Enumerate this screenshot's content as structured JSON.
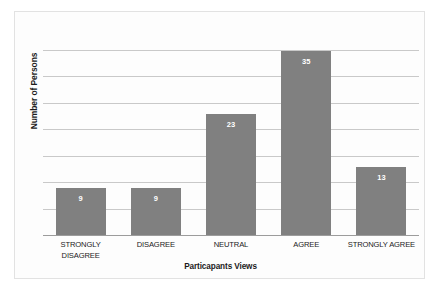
{
  "chart_data": {
    "type": "bar",
    "title": "",
    "xlabel": "Particapants Views",
    "ylabel": "Number of Persons",
    "categories": [
      "STRONGLY DISAGREE",
      "DISAGREE",
      "NEUTRAL",
      "AGREE",
      "STRONGLY AGREE"
    ],
    "category_lines": [
      [
        "STRONGLY",
        "DISAGREE"
      ],
      [
        "DISAGREE"
      ],
      [
        "NEUTRAL"
      ],
      [
        "AGREE"
      ],
      [
        "STRONGLY AGREE"
      ]
    ],
    "values": [
      9,
      9,
      23,
      35,
      13
    ],
    "value_labels": [
      "9",
      "9",
      "23",
      "35",
      "13"
    ],
    "ylim": [
      0,
      40
    ],
    "ytick_step": 5,
    "ytick_labels_shown": false,
    "gridlines": 7,
    "grid": true,
    "legend": "none",
    "bar_color": "#808080",
    "value_label_color": "#ffffff",
    "gridline_color": "#c9c9c9",
    "axis_color": "#9c9c9c",
    "plot_background": "#fdfdfd",
    "border_color": "#e2e2e2"
  }
}
